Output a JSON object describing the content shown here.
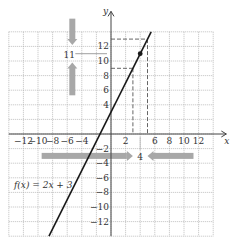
{
  "chart_data": {
    "type": "line",
    "title": "",
    "function_label": "f(x) = 2x + 3",
    "xlabel": "x",
    "ylabel": "y",
    "xlim": [
      -14,
      14
    ],
    "ylim": [
      -14,
      14
    ],
    "grid": true,
    "grid_step": 2,
    "x_ticks": [
      -12,
      -10,
      -8,
      -6,
      -4,
      2,
      6,
      8,
      10,
      12
    ],
    "y_ticks": [
      12,
      10,
      8,
      6,
      4,
      -2,
      -4,
      -6,
      -8,
      -10,
      -12
    ],
    "series": [
      {
        "name": "f(x) = 2x + 3",
        "slope": 2,
        "intercept": 3,
        "x": [
          -8.5,
          5.5
        ],
        "y": [
          -14,
          14
        ]
      }
    ],
    "highlighted_point": {
      "x": 4,
      "y": 11
    },
    "dashed_guides": [
      {
        "x": 3,
        "y": 9
      },
      {
        "x": 5,
        "y": 13
      }
    ],
    "annotations": [
      {
        "text": "11",
        "position": "y-axis",
        "value": 11,
        "note": "gray arrows converge on y = 11"
      },
      {
        "text": "4",
        "position": "x-axis",
        "value": 4,
        "note": "gray arrows converge on x = 4"
      }
    ]
  },
  "labels": {
    "x_axis": "x",
    "y_axis": "y",
    "function": "f(x) = 2x + 3",
    "y_target": "11",
    "x_target": "4",
    "x_ticks": [
      "−12",
      "−10",
      "−8",
      "−6",
      "−4",
      "2",
      "6",
      "8",
      "10",
      "12"
    ],
    "y_ticks": [
      "12",
      "10",
      "8",
      "6",
      "4",
      "−2",
      "−4",
      "−6",
      "−8",
      "−10",
      "−12"
    ]
  },
  "colors": {
    "line": "#1a1a1a",
    "grid": "#b0b0b0",
    "axis": "#444444",
    "arrow": "#a8a8a8",
    "dashed": "#555555"
  }
}
